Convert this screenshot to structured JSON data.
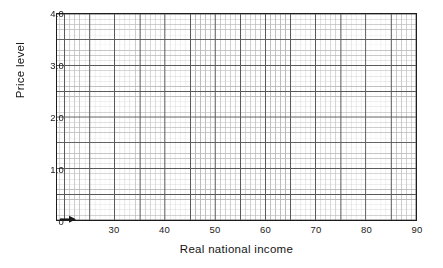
{
  "chart_data": {
    "type": "line",
    "title": "",
    "subtitle": "",
    "xlabel": "Real national income",
    "ylabel": "Price level",
    "xlim": [
      18.5,
      90
    ],
    "ylim": [
      0,
      4.0
    ],
    "xticks": [
      30,
      40,
      50,
      60,
      70,
      80,
      90
    ],
    "xtick_labels": [
      "30",
      "40",
      "50",
      "60",
      "70",
      "80",
      "90"
    ],
    "yticks": [
      0,
      1.0,
      2.0,
      3.0,
      4.0
    ],
    "ytick_labels": [
      "0",
      "1.0",
      "2.0",
      "3.0",
      "4.0"
    ],
    "series": [],
    "values": [],
    "categories": [],
    "annotations": [
      {
        "name": "origin-arrow",
        "symbol": "➤",
        "x": 20.5,
        "y": 0.06,
        "description": "small right-pointing arrow just above origin"
      }
    ],
    "grid": {
      "enabled": true,
      "minor": true,
      "x_minor_step": 1,
      "x_major_step": 5,
      "y_minor_step": 0.1,
      "y_major_step": 0.5,
      "minor_color": "#b9b9b9",
      "major_color": "#5a5a5a",
      "border_color": "#1d1d1d",
      "background": "#ffffff"
    },
    "legend": {
      "visible": false,
      "position": "none"
    }
  },
  "axes": {
    "x_title": "Real national income",
    "y_title": "Price level"
  },
  "ticks": {
    "x": [
      {
        "label": "30",
        "value": 30
      },
      {
        "label": "40",
        "value": 40
      },
      {
        "label": "50",
        "value": 50
      },
      {
        "label": "60",
        "value": 60
      },
      {
        "label": "70",
        "value": 70
      },
      {
        "label": "80",
        "value": 80
      },
      {
        "label": "90",
        "value": 90
      }
    ],
    "y": [
      {
        "label": "0",
        "value": 0
      },
      {
        "label": "1.0",
        "value": 1.0
      },
      {
        "label": "2.0",
        "value": 2.0
      },
      {
        "label": "3.0",
        "value": 3.0
      },
      {
        "label": "4.0",
        "value": 4.0
      }
    ]
  }
}
